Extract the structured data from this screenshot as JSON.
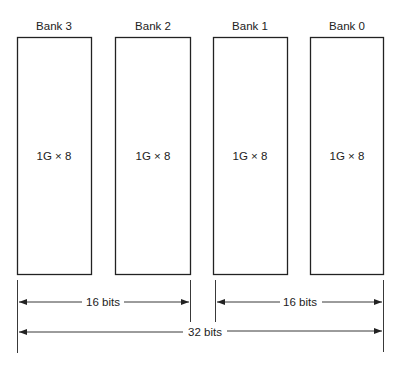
{
  "banks": [
    {
      "name": "Bank 3",
      "content": "1G × 8"
    },
    {
      "name": "Bank 2",
      "content": "1G × 8"
    },
    {
      "name": "Bank 1",
      "content": "1G × 8"
    },
    {
      "name": "Bank 0",
      "content": "1G × 8"
    }
  ],
  "dimensions": {
    "left_half": "16 bits",
    "right_half": "16 bits",
    "total": "32 bits"
  },
  "colors": {
    "line": "#222222",
    "background": "#ffffff"
  }
}
